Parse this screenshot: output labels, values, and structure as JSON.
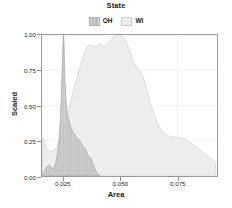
{
  "chart_data": {
    "type": "area",
    "title": "",
    "xlabel": "Area",
    "ylabel": "Scaled",
    "xlim": [
      0.0155,
      0.0925
    ],
    "ylim": [
      0.0,
      1.0
    ],
    "xticks": [
      0.025,
      0.05,
      0.075
    ],
    "xtick_labels": [
      "0.025",
      "0.050",
      "0.075"
    ],
    "yticks": [
      0.0,
      0.25,
      0.5,
      0.75,
      1.0
    ],
    "ytick_labels": [
      "0.00",
      "0.25",
      "0.50",
      "0.75",
      "1.00"
    ],
    "grid": true,
    "legend": {
      "title": "State",
      "position": "top-center",
      "entries": [
        {
          "label": "OH",
          "color": "#b9b9b9",
          "pattern": "vertical-hatch"
        },
        {
          "label": "WI",
          "color": "#ececec",
          "pattern": "solid"
        }
      ]
    },
    "series": [
      {
        "name": "OH",
        "color": "#b9b9b9",
        "x": [
          0.0158,
          0.017,
          0.0182,
          0.0192,
          0.02,
          0.0208,
          0.0214,
          0.022,
          0.0226,
          0.0232,
          0.0237,
          0.0241,
          0.0245,
          0.0248,
          0.025,
          0.0252,
          0.0254,
          0.0258,
          0.0262,
          0.0268,
          0.0275,
          0.0283,
          0.0292,
          0.0302,
          0.0312,
          0.0322,
          0.033,
          0.0338,
          0.0344,
          0.035,
          0.0356,
          0.0362,
          0.0368,
          0.0374,
          0.038,
          0.0386,
          0.0392,
          0.0398,
          0.0404,
          0.041
        ],
        "y": [
          0.01,
          0.045,
          0.075,
          0.07,
          0.055,
          0.06,
          0.085,
          0.13,
          0.2,
          0.3,
          0.44,
          0.62,
          0.82,
          0.95,
          1.0,
          0.93,
          0.79,
          0.61,
          0.5,
          0.43,
          0.38,
          0.34,
          0.31,
          0.285,
          0.265,
          0.245,
          0.225,
          0.205,
          0.195,
          0.175,
          0.15,
          0.135,
          0.13,
          0.11,
          0.08,
          0.055,
          0.035,
          0.02,
          0.01,
          0.0
        ]
      },
      {
        "name": "WI",
        "color": "#ececec",
        "x": [
          0.0158,
          0.017,
          0.0185,
          0.02,
          0.0215,
          0.023,
          0.0245,
          0.026,
          0.0275,
          0.029,
          0.0305,
          0.032,
          0.0335,
          0.035,
          0.0362,
          0.0375,
          0.0388,
          0.04,
          0.0412,
          0.0425,
          0.0438,
          0.045,
          0.0462,
          0.0475,
          0.0488,
          0.05,
          0.0512,
          0.0525,
          0.0538,
          0.055,
          0.0562,
          0.0575,
          0.0588,
          0.06,
          0.0615,
          0.063,
          0.0648,
          0.0665,
          0.0685,
          0.0705,
          0.0725,
          0.0745,
          0.0765,
          0.0785,
          0.0805,
          0.0825,
          0.0845,
          0.0865,
          0.0885,
          0.0905,
          0.092
        ],
        "y": [
          0.27,
          0.22,
          0.18,
          0.175,
          0.195,
          0.24,
          0.31,
          0.4,
          0.49,
          0.58,
          0.67,
          0.76,
          0.84,
          0.905,
          0.93,
          0.928,
          0.918,
          0.925,
          0.94,
          0.92,
          0.935,
          0.955,
          0.975,
          0.99,
          0.998,
          1.0,
          0.985,
          0.95,
          0.9,
          0.845,
          0.8,
          0.77,
          0.74,
          0.7,
          0.62,
          0.53,
          0.44,
          0.37,
          0.318,
          0.29,
          0.278,
          0.275,
          0.272,
          0.262,
          0.24,
          0.215,
          0.19,
          0.165,
          0.14,
          0.115,
          0.095
        ]
      }
    ]
  }
}
